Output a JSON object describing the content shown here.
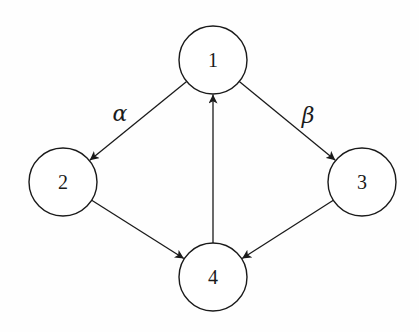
{
  "diagram": {
    "type": "directed-graph",
    "colors": {
      "stroke": "#1a1a1a",
      "background": "#ffffff"
    },
    "nodes": [
      {
        "id": "1",
        "label": "1",
        "cx": 213,
        "cy": 60,
        "r": 34
      },
      {
        "id": "2",
        "label": "2",
        "cx": 63,
        "cy": 182,
        "r": 34
      },
      {
        "id": "3",
        "label": "3",
        "cx": 362,
        "cy": 182,
        "r": 34
      },
      {
        "id": "4",
        "label": "4",
        "cx": 213,
        "cy": 277,
        "r": 34
      }
    ],
    "edges": [
      {
        "from": "1",
        "to": "2",
        "label": "α"
      },
      {
        "from": "1",
        "to": "3",
        "label": "β"
      },
      {
        "from": "2",
        "to": "4",
        "label": ""
      },
      {
        "from": "3",
        "to": "4",
        "label": ""
      },
      {
        "from": "4",
        "to": "1",
        "label": ""
      }
    ],
    "edge_labels": {
      "alpha": {
        "text": "α",
        "x": 120,
        "y": 113
      },
      "beta": {
        "text": "β",
        "x": 308,
        "y": 115
      }
    }
  }
}
